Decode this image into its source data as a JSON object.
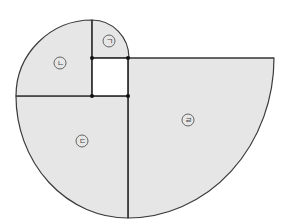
{
  "diagram": {
    "colors": {
      "fill": "#e6e6e6",
      "stroke": "#3a3a3a",
      "square": "#ffffff"
    },
    "regions": [
      {
        "id": "giyeok",
        "label": "ㄱ"
      },
      {
        "id": "nieun",
        "label": "ㄴ"
      },
      {
        "id": "digeut",
        "label": "ㄷ"
      },
      {
        "id": "rieul",
        "label": "ㄹ"
      }
    ],
    "points": [
      {
        "x": 92,
        "y": 58
      },
      {
        "x": 128,
        "y": 58
      },
      {
        "x": 92,
        "y": 96
      },
      {
        "x": 128,
        "y": 96
      }
    ]
  }
}
